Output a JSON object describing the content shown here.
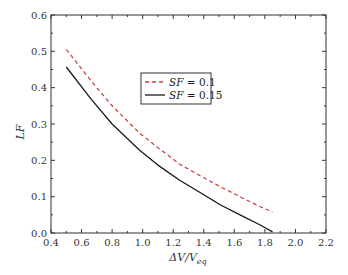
{
  "chart_data": {
    "type": "line",
    "title": "",
    "xlabel_parts": [
      "ΔV/V",
      "eq"
    ],
    "xlabel": "ΔV/V_eq",
    "ylabel": "LF",
    "xlim": [
      0.4,
      2.2
    ],
    "ylim": [
      0.0,
      0.6
    ],
    "xticks": [
      0.4,
      0.6,
      0.8,
      1.0,
      1.2,
      1.4,
      1.6,
      1.8,
      2.0,
      2.2
    ],
    "xtick_labels": [
      "0.4",
      "0.6",
      "0.8",
      "1.0",
      "1.2",
      "1.4",
      "1.6",
      "1.8",
      "2.0",
      "2.2"
    ],
    "yticks": [
      0.0,
      0.1,
      0.2,
      0.3,
      0.4,
      0.5,
      0.6
    ],
    "ytick_labels": [
      "0.0",
      "0.1",
      "0.2",
      "0.3",
      "0.4",
      "0.5",
      "0.6"
    ],
    "grid": false,
    "legend_position": "center",
    "series": [
      {
        "name": "SF = 0.1",
        "legend_italic": "SF",
        "legend_rest": " = 0.1",
        "style": "dashed",
        "color": "#d03a3a",
        "x": [
          0.5,
          0.66,
          0.8,
          0.98,
          1.1,
          1.24,
          1.4,
          1.51,
          1.65,
          1.77,
          1.85
        ],
        "y": [
          0.505,
          0.42,
          0.35,
          0.275,
          0.235,
          0.19,
          0.152,
          0.127,
          0.097,
          0.072,
          0.058
        ]
      },
      {
        "name": "SF = 0.15",
        "legend_italic": "SF",
        "legend_rest": " = 0.15",
        "style": "solid",
        "color": "#1a1a1a",
        "x": [
          0.5,
          0.66,
          0.8,
          0.98,
          1.1,
          1.24,
          1.4,
          1.51,
          1.65,
          1.77,
          1.85
        ],
        "y": [
          0.457,
          0.37,
          0.3,
          0.228,
          0.187,
          0.146,
          0.105,
          0.077,
          0.047,
          0.022,
          0.003
        ]
      }
    ]
  }
}
